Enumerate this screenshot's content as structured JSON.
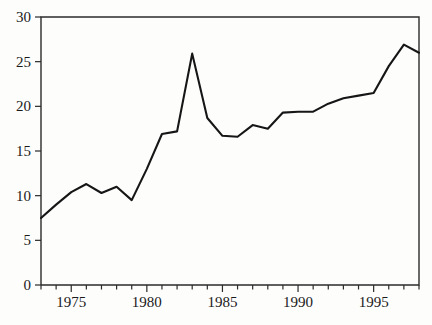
{
  "chart_data": {
    "type": "line",
    "title": "",
    "subtitle": "",
    "xlabel": "",
    "ylabel": "",
    "xlim": [
      1973,
      1998
    ],
    "ylim": [
      0,
      30
    ],
    "grid": false,
    "legend": null,
    "legend_position": "none",
    "x_ticks_major": [
      1975,
      1980,
      1985,
      1990,
      1995
    ],
    "x_tick_labels": [
      "1975",
      "1980",
      "1985",
      "1990",
      "1995"
    ],
    "x_ticks_minor_step": 1,
    "y_ticks": [
      0,
      5,
      10,
      15,
      20,
      25,
      30
    ],
    "y_tick_labels": [
      "0",
      "5",
      "10",
      "15",
      "20",
      "25",
      "30"
    ],
    "x": [
      1973,
      1974,
      1975,
      1976,
      1977,
      1978,
      1979,
      1980,
      1981,
      1982,
      1983,
      1984,
      1985,
      1986,
      1987,
      1988,
      1989,
      1990,
      1991,
      1992,
      1993,
      1994,
      1995,
      1996,
      1997,
      1998
    ],
    "values": [
      7.5,
      9.0,
      10.4,
      11.3,
      10.3,
      11.0,
      9.5,
      13.0,
      16.9,
      17.2,
      25.9,
      18.7,
      16.7,
      16.6,
      17.9,
      17.5,
      19.3,
      19.4,
      19.4,
      20.3,
      20.9,
      21.2,
      21.5,
      24.5,
      26.9,
      26.0
    ],
    "series": [
      {
        "name": "series-1",
        "color": "#161616",
        "values": [
          7.5,
          9.0,
          10.4,
          11.3,
          10.3,
          11.0,
          9.5,
          13.0,
          16.9,
          17.2,
          25.9,
          18.7,
          16.7,
          16.6,
          17.9,
          17.5,
          19.3,
          19.4,
          19.4,
          20.3,
          20.9,
          21.2,
          21.5,
          24.5,
          26.9,
          26.0
        ]
      }
    ]
  },
  "style": {
    "background": "#fdfdfc",
    "line_color": "#161616",
    "axis_color": "#2b2b2b",
    "text_color": "#1a1a1a"
  }
}
